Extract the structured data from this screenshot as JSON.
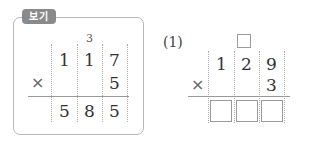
{
  "example": {
    "badge_label": "보기",
    "carry": "3",
    "multiplicand": [
      "1",
      "1",
      "7"
    ],
    "operator": "×",
    "multiplier": "5",
    "product": [
      "5",
      "8",
      "5"
    ]
  },
  "problem1": {
    "label": "(1)",
    "multiplicand": [
      "1",
      "2",
      "9"
    ],
    "operator": "×",
    "multiplier": "3",
    "carry_box": "",
    "answer_boxes": [
      "",
      "",
      ""
    ]
  }
}
